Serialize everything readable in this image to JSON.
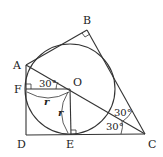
{
  "diagram": {
    "type": "geometry",
    "points": {
      "A": {
        "label": "A",
        "x": 26,
        "y": 65
      },
      "B": {
        "label": "B",
        "x": 87,
        "y": 30
      },
      "C": {
        "label": "C",
        "x": 145,
        "y": 134
      },
      "D": {
        "label": "D",
        "x": 26,
        "y": 135
      },
      "E": {
        "label": "E",
        "x": 71,
        "y": 135
      },
      "F": {
        "label": "F",
        "x": 26,
        "y": 89
      },
      "O": {
        "label": "O",
        "x": 70,
        "y": 89
      }
    },
    "circle": {
      "center": "O",
      "radius": 45
    },
    "angles": {
      "AOF": "30°",
      "ACB_upper": "30°",
      "ACD_lower": "30°"
    },
    "radius_labels": {
      "FO": "r",
      "OE": "r"
    },
    "colors": {
      "stroke": "#333333",
      "text": "#222222",
      "background": "#ffffff"
    }
  }
}
